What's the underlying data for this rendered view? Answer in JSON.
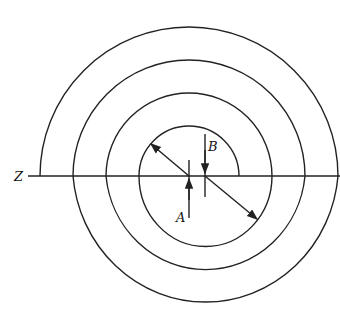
{
  "diagram": {
    "labels": {
      "axis": "Z",
      "center_a": "A",
      "center_b": "B"
    },
    "colors": {
      "stroke": "#222222",
      "background": "#ffffff"
    }
  }
}
